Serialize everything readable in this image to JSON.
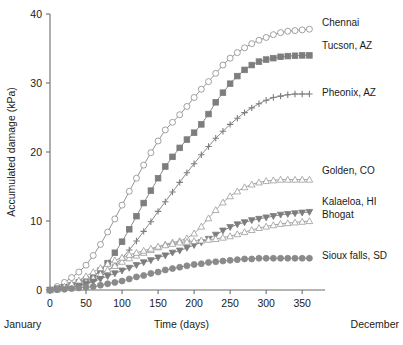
{
  "chart_data": {
    "type": "line",
    "title": "",
    "xlabel": "Time (days)",
    "ylabel": "Accumulated damage (kPa)",
    "xlim": [
      0,
      365
    ],
    "ylim": [
      0,
      40
    ],
    "xticks": [
      0,
      50,
      100,
      150,
      200,
      250,
      300,
      350
    ],
    "yticks": [
      0,
      10,
      20,
      30,
      40
    ],
    "xtick_labels": [
      "0",
      "50",
      "100",
      "150",
      "200",
      "250",
      "300",
      "350"
    ],
    "ytick_labels": [
      "0",
      "10",
      "20",
      "30",
      "40"
    ],
    "grid": false,
    "legend_position": "right-inline-end-of-line",
    "x_start_annotation": "January",
    "x_end_annotation": "December",
    "x": [
      0,
      10,
      20,
      30,
      40,
      50,
      60,
      70,
      80,
      90,
      100,
      110,
      120,
      130,
      140,
      150,
      160,
      170,
      180,
      190,
      200,
      210,
      220,
      230,
      240,
      250,
      260,
      270,
      280,
      290,
      300,
      310,
      320,
      330,
      340,
      350,
      360
    ],
    "series": [
      {
        "name": "Chennai",
        "marker": "open-circle",
        "color": "#8a8a8a",
        "line_color": "#8a8a8a",
        "filled": false,
        "values": [
          0.0,
          0.5,
          1.1,
          1.8,
          2.6,
          3.6,
          5.0,
          6.6,
          8.4,
          10.3,
          12.3,
          14.3,
          16.2,
          18.1,
          19.9,
          21.6,
          23.2,
          24.3,
          25.4,
          26.6,
          27.9,
          29.1,
          30.2,
          31.4,
          32.6,
          33.6,
          34.4,
          35.1,
          35.7,
          36.2,
          36.6,
          37.0,
          37.3,
          37.5,
          37.6,
          37.7,
          37.8
        ]
      },
      {
        "name": "Tucson, AZ",
        "marker": "filled-square",
        "color": "#7d7d7d",
        "line_color": "#7d7d7d",
        "filled": true,
        "values": [
          0.0,
          0.2,
          0.4,
          0.7,
          1.1,
          1.5,
          2.0,
          2.8,
          3.9,
          5.4,
          7.0,
          8.8,
          10.7,
          12.6,
          14.4,
          16.2,
          17.9,
          19.3,
          20.6,
          21.8,
          22.8,
          24.0,
          25.5,
          27.2,
          28.6,
          29.9,
          31.0,
          31.9,
          32.6,
          33.1,
          33.4,
          33.6,
          33.8,
          33.9,
          33.95,
          34.0,
          34.0
        ]
      },
      {
        "name": "Pheonix, AZ",
        "marker": "plus",
        "color": "#7d7d7d",
        "line_color": "#7d7d7d",
        "filled": true,
        "values": [
          0.0,
          0.1,
          0.2,
          0.4,
          0.6,
          0.9,
          1.3,
          1.9,
          2.7,
          3.6,
          4.6,
          5.8,
          7.1,
          8.5,
          9.9,
          11.4,
          12.8,
          14.2,
          15.6,
          17.0,
          18.3,
          19.6,
          20.8,
          22.0,
          23.0,
          24.0,
          24.9,
          25.7,
          26.4,
          27.0,
          27.5,
          27.9,
          28.1,
          28.3,
          28.4,
          28.4,
          28.4
        ]
      },
      {
        "name": "Golden, CO",
        "marker": "open-triangle-up",
        "color": "#9a9a9a",
        "line_color": "#9a9a9a",
        "filled": false,
        "values": [
          0.0,
          0.1,
          0.3,
          0.5,
          0.8,
          1.2,
          1.7,
          2.3,
          2.9,
          3.5,
          4.1,
          4.6,
          5.0,
          5.4,
          5.8,
          6.2,
          6.6,
          6.9,
          7.1,
          7.5,
          8.2,
          9.2,
          10.4,
          11.6,
          12.7,
          13.6,
          14.3,
          14.9,
          15.3,
          15.6,
          15.8,
          15.9,
          16.0,
          16.0,
          16.0,
          16.0,
          16.0
        ]
      },
      {
        "name": "Kalaeloa, HI",
        "marker": "filled-triangle-down",
        "color": "#7d7d7d",
        "line_color": "#7d7d7d",
        "filled": true,
        "values": [
          0.0,
          0.1,
          0.2,
          0.4,
          0.6,
          0.9,
          1.2,
          1.6,
          2.0,
          2.4,
          2.8,
          3.2,
          3.6,
          4.0,
          4.3,
          4.7,
          5.0,
          5.4,
          5.7,
          6.1,
          6.5,
          6.9,
          7.4,
          8.0,
          8.6,
          9.1,
          9.5,
          9.8,
          10.1,
          10.3,
          10.5,
          10.7,
          10.9,
          11.0,
          11.1,
          11.2,
          11.3
        ]
      },
      {
        "name": "Bhogat",
        "marker": "open-triangle-up",
        "color": "#9a9a9a",
        "line_color": "#9a9a9a",
        "filled": false,
        "values": [
          0.0,
          0.2,
          0.5,
          0.9,
          1.4,
          2.0,
          2.6,
          3.2,
          3.8,
          4.3,
          4.7,
          5.1,
          5.4,
          5.7,
          6.0,
          6.3,
          6.5,
          6.7,
          6.9,
          7.0,
          7.1,
          7.2,
          7.3,
          7.4,
          7.6,
          7.8,
          8.1,
          8.4,
          8.7,
          9.0,
          9.2,
          9.4,
          9.6,
          9.7,
          9.8,
          9.9,
          10.0
        ]
      },
      {
        "name": "Sioux falls, SD",
        "marker": "filled-circle",
        "color": "#8a8a8a",
        "line_color": "#8a8a8a",
        "filled": true,
        "values": [
          0.0,
          0.05,
          0.1,
          0.2,
          0.3,
          0.4,
          0.5,
          0.7,
          0.9,
          1.1,
          1.3,
          1.6,
          1.9,
          2.1,
          2.4,
          2.6,
          2.9,
          3.1,
          3.3,
          3.5,
          3.7,
          3.8,
          4.0,
          4.1,
          4.2,
          4.3,
          4.4,
          4.5,
          4.5,
          4.6,
          4.6,
          4.6,
          4.6,
          4.6,
          4.6,
          4.6,
          4.6
        ]
      }
    ],
    "legend_entries": [
      {
        "label": "Chennai",
        "y_at_label": 26
      },
      {
        "label": "Tucson, AZ",
        "y_at_label": 49
      },
      {
        "label": "Pheonix, AZ",
        "y_at_label": 96
      },
      {
        "label": "Golden, CO",
        "y_at_label": 174
      },
      {
        "label": "Kalaeloa, HI",
        "y_at_label": 205
      },
      {
        "label": "Bhogat",
        "y_at_label": 218
      },
      {
        "label": "Sioux falls, SD",
        "y_at_label": 259
      }
    ]
  },
  "colors": {
    "axis": "#6d6d6d",
    "text": "#1b1b1b",
    "background": "#ffffff",
    "marker_grey": "#7d7d7d",
    "marker_light": "#9a9a9a"
  }
}
